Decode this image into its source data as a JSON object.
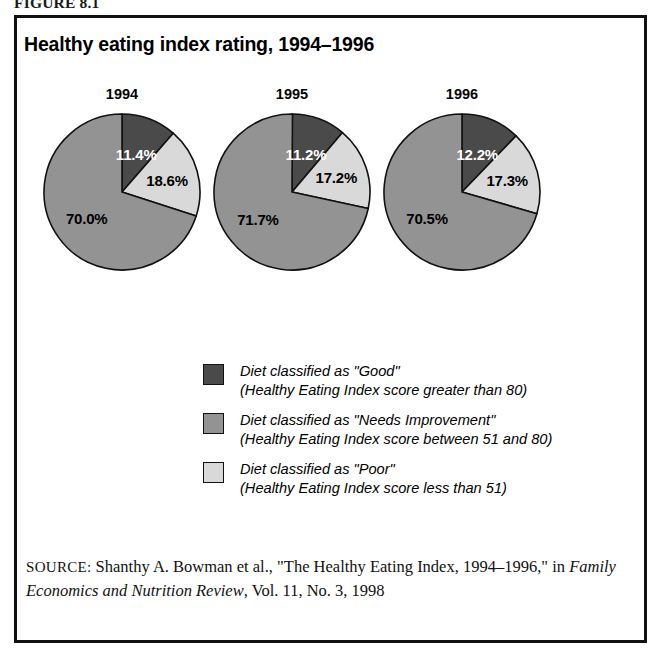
{
  "figure": {
    "label": "FIGURE 8.1",
    "title": "Healthy eating index rating, 1994–1996"
  },
  "colors": {
    "good": "#4a4a4a",
    "needs_improvement": "#939393",
    "poor": "#d9d9d9",
    "outline": "#111111",
    "frame": "#111111",
    "background": "#ffffff"
  },
  "legend": {
    "items": [
      {
        "swatch": "good",
        "line1": "Diet classified as \"Good\"",
        "line2": "(Healthy Eating Index score greater than 80)"
      },
      {
        "swatch": "needs_improvement",
        "line1": "Diet classified as \"Needs Improvement\"",
        "line2": "(Healthy Eating Index score between 51 and 80)"
      },
      {
        "swatch": "poor",
        "line1": "Diet classified as \"Poor\"",
        "line2": "(Healthy Eating Index score less than 51)"
      }
    ]
  },
  "source": {
    "label": "SOURCE:",
    "text_before_journal": " Shanthy A. Bowman et al., \"The Healthy Eating Index, 1994–1996,\" in ",
    "journal": "Family Economics and Nutrition Review",
    "text_after_journal": ", Vol. 11, No. 3, 1998"
  },
  "chart_data": {
    "type": "pie",
    "title": "Healthy eating index rating, 1994–1996",
    "xlabel": "",
    "ylabel": "",
    "legend_position": "bottom-center",
    "grid": false,
    "categories": [
      "Good",
      "Needs Improvement",
      "Poor"
    ],
    "units": "percent",
    "charts": [
      {
        "year": "1994",
        "labels": [
          "11.4%",
          "70.0%",
          "18.6%"
        ],
        "slices": [
          {
            "name": "Good",
            "value": 11.4,
            "label": "11.4%",
            "color": "#4a4a4a"
          },
          {
            "name": "Poor",
            "value": 18.6,
            "label": "18.6%",
            "color": "#d9d9d9"
          },
          {
            "name": "Needs Improvement",
            "value": 70.0,
            "label": "70.0%",
            "color": "#939393"
          }
        ]
      },
      {
        "year": "1995",
        "labels": [
          "11.2%",
          "71.7%",
          "17.2%"
        ],
        "slices": [
          {
            "name": "Good",
            "value": 11.2,
            "label": "11.2%",
            "color": "#4a4a4a"
          },
          {
            "name": "Poor",
            "value": 17.2,
            "label": "17.2%",
            "color": "#d9d9d9"
          },
          {
            "name": "Needs Improvement",
            "value": 71.7,
            "label": "71.7%",
            "color": "#939393"
          }
        ]
      },
      {
        "year": "1996",
        "labels": [
          "12.2%",
          "70.5%",
          "17.3%"
        ],
        "slices": [
          {
            "name": "Good",
            "value": 12.2,
            "label": "12.2%",
            "color": "#4a4a4a"
          },
          {
            "name": "Poor",
            "value": 17.3,
            "label": "17.3%",
            "color": "#d9d9d9"
          },
          {
            "name": "Needs Improvement",
            "value": 70.5,
            "label": "70.5%",
            "color": "#939393"
          }
        ]
      }
    ]
  }
}
